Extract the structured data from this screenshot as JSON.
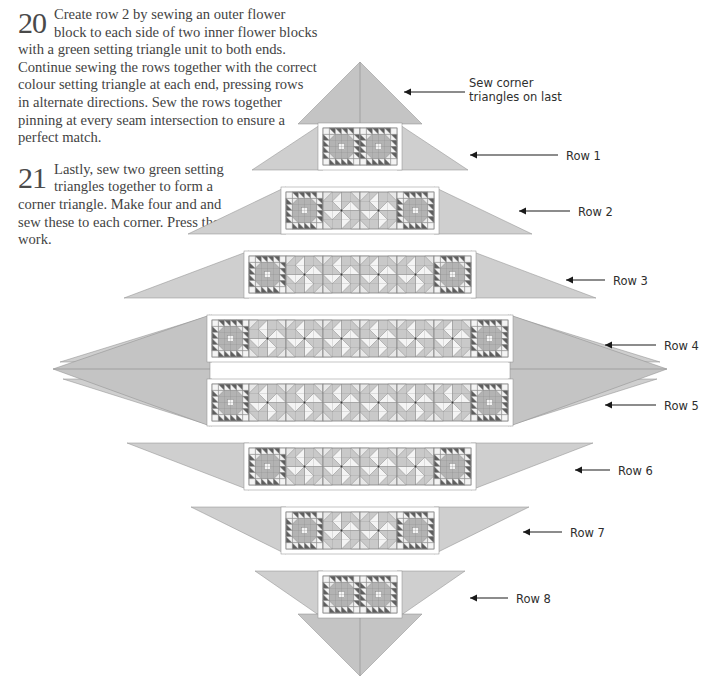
{
  "page": {
    "width": 719,
    "height": 700,
    "background": "#ffffff"
  },
  "instructions": [
    {
      "number": "20",
      "text": "Create row 2 by sewing an outer flower block to each side of two inner flower blocks with a green setting triangle unit to both ends. Continue sewing the rows together with the correct colour setting triangle at each end, pressing rows in alternate directions. Sew the rows together pinning at every seam intersection to ensure a perfect match."
    },
    {
      "number": "21",
      "text": "Lastly, sew two green setting triangles together to form a corner triangle. Make four and and sew these to each corner. Press the work."
    }
  ],
  "callouts": {
    "corner_note": "Sew corner\ntriangles on last",
    "corner_note_line1": "Sew corner",
    "corner_note_line2": "triangles on last",
    "rows": [
      {
        "label": "Row 1",
        "x": 566,
        "y": 150,
        "arrow_from_x": 558,
        "arrow_to_x": 470,
        "arrow_y": 155
      },
      {
        "label": "Row 2",
        "x": 578,
        "y": 206,
        "arrow_from_x": 570,
        "arrow_to_x": 519,
        "arrow_y": 211
      },
      {
        "label": "Row 3",
        "x": 613,
        "y": 275,
        "arrow_from_x": 605,
        "arrow_to_x": 566,
        "arrow_y": 280
      },
      {
        "label": "Row 4",
        "x": 664,
        "y": 340,
        "arrow_from_x": 656,
        "arrow_to_x": 605,
        "arrow_y": 345
      },
      {
        "label": "Row 5",
        "x": 664,
        "y": 400,
        "arrow_from_x": 656,
        "arrow_to_x": 605,
        "arrow_y": 405
      },
      {
        "label": "Row 6",
        "x": 618,
        "y": 465,
        "arrow_from_x": 610,
        "arrow_to_x": 575,
        "arrow_y": 470
      },
      {
        "label": "Row 7",
        "x": 570,
        "y": 527,
        "arrow_from_x": 562,
        "arrow_to_x": 523,
        "arrow_y": 532
      },
      {
        "label": "Row 8",
        "x": 516,
        "y": 593,
        "arrow_from_x": 508,
        "arrow_to_x": 470,
        "arrow_y": 598
      }
    ]
  },
  "quilt": {
    "description": "On-point diamond quilt layout, 8 rows of blocks with setting triangles",
    "center_x": 360,
    "top_y": 62,
    "bottom_y": 676,
    "block_size": 37,
    "row_gap": 2,
    "rows": [
      {
        "index": 1,
        "blocks": 2,
        "pattern": [
          "flower",
          "flower"
        ],
        "y": 128,
        "center_x": 360
      },
      {
        "index": 2,
        "blocks": 4,
        "pattern": [
          "flower",
          "star",
          "star",
          "flower"
        ],
        "y": 192,
        "center_x": 360
      },
      {
        "index": 3,
        "blocks": 6,
        "pattern": [
          "flower",
          "star",
          "star",
          "star",
          "star",
          "flower"
        ],
        "y": 256,
        "center_x": 360
      },
      {
        "index": 4,
        "blocks": 8,
        "pattern": [
          "flower",
          "star",
          "star",
          "star",
          "star",
          "star",
          "star",
          "flower"
        ],
        "y": 320,
        "center_x": 360
      },
      {
        "index": 5,
        "blocks": 8,
        "pattern": [
          "flower",
          "star",
          "star",
          "star",
          "star",
          "star",
          "star",
          "flower"
        ],
        "y": 384,
        "center_x": 360
      },
      {
        "index": 6,
        "blocks": 6,
        "pattern": [
          "flower",
          "star",
          "star",
          "star",
          "star",
          "flower"
        ],
        "y": 448,
        "center_x": 360
      },
      {
        "index": 7,
        "blocks": 4,
        "pattern": [
          "flower",
          "star",
          "star",
          "flower"
        ],
        "y": 512,
        "center_x": 360
      },
      {
        "index": 8,
        "blocks": 2,
        "pattern": [
          "flower",
          "flower"
        ],
        "y": 576,
        "center_x": 360
      }
    ]
  },
  "colors": {
    "setting_triangle": "#cfcfcf",
    "setting_triangle_light": "#dddddd",
    "setting_triangle_dark": "#c4c4c4",
    "block_background": "#c9c9c9",
    "block_light": "#e8e8e8",
    "block_white": "#f4f4f4",
    "block_mid": "#b3b3b3",
    "block_dark": "#5e5e5e",
    "block_darker": "#4f4f4f",
    "outline": "#8a8a8a",
    "sash_white": "#ffffff",
    "text": "#434343",
    "callout_text": "#2e2e2e",
    "arrow": "#1a1a1a"
  }
}
